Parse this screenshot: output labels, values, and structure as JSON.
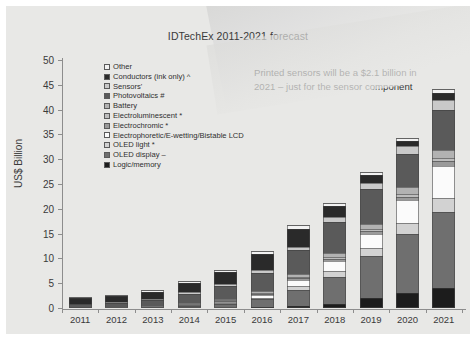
{
  "chart_data": {
    "type": "bar",
    "stacked": true,
    "title": "IDTechEx 2011-2021 forecast",
    "xlabel": "",
    "ylabel": "US$ Billion",
    "ylim": [
      0,
      50
    ],
    "yticks": [
      0,
      5,
      10,
      15,
      20,
      25,
      30,
      35,
      40,
      45,
      50
    ],
    "grid": false,
    "legend_position": "inside-top-left",
    "categories": [
      "2011",
      "2012",
      "2013",
      "2014",
      "2015",
      "2016",
      "2017",
      "2018",
      "2019",
      "2020",
      "2021"
    ],
    "annotation": "Printed sensors will be a $2.1 billion in 2021 – just for the sensor component",
    "series": [
      {
        "name": "Logic/memory",
        "color": "#1c1c1c",
        "values": [
          0.0,
          0.0,
          0.0,
          0.05,
          0.1,
          0.15,
          0.4,
          0.8,
          2.1,
          3.0,
          4.1
        ]
      },
      {
        "name": "OLED display –",
        "color": "#6f6f6f",
        "values": [
          0.0,
          0.0,
          0.1,
          0.3,
          0.8,
          1.6,
          3.3,
          5.5,
          8.4,
          12.0,
          15.3
        ]
      },
      {
        "name": "OLED light *",
        "color": "#d2d2d2",
        "values": [
          0.0,
          0.0,
          0.0,
          0.05,
          0.1,
          0.3,
          0.7,
          1.1,
          1.5,
          2.2,
          2.8
        ]
      },
      {
        "name": "Electrophoretic/E-wetting/Bistable LCD",
        "color": "#fbfbfb",
        "values": [
          0.0,
          0.0,
          0.0,
          0.1,
          0.2,
          0.6,
          1.3,
          2.1,
          3.0,
          4.5,
          6.5
        ]
      },
      {
        "name": "Electrochromic *",
        "color": "#9a9a9a",
        "values": [
          0.0,
          0.0,
          0.05,
          0.1,
          0.15,
          0.2,
          0.3,
          0.4,
          0.5,
          0.7,
          0.9
        ]
      },
      {
        "name": "Electroluminescent *",
        "color": "#bdbdbd",
        "values": [
          0.05,
          0.1,
          0.1,
          0.15,
          0.2,
          0.25,
          0.3,
          0.4,
          0.5,
          0.6,
          0.7
        ]
      },
      {
        "name": "Battery",
        "color": "#b2b2b2",
        "values": [
          0.05,
          0.1,
          0.15,
          0.2,
          0.3,
          0.4,
          0.6,
          0.8,
          1.0,
          1.3,
          1.6
        ]
      },
      {
        "name": "Photovoltaics #",
        "color": "#5a5a5a",
        "values": [
          0.7,
          0.9,
          1.3,
          1.9,
          2.6,
          3.6,
          4.8,
          6.3,
          7.0,
          6.8,
          8.0
        ]
      },
      {
        "name": "Sensors'",
        "color": "#c9c9c9",
        "values": [
          0.1,
          0.15,
          0.2,
          0.3,
          0.4,
          0.5,
          0.7,
          0.9,
          1.2,
          1.6,
          2.1
        ]
      },
      {
        "name": "Conductors (ink only) ^",
        "color": "#2a2a2a",
        "values": [
          1.2,
          1.2,
          1.4,
          1.9,
          2.4,
          3.2,
          3.6,
          2.2,
          1.7,
          1.0,
          1.4
        ]
      },
      {
        "name": "Other",
        "color": "#f2f2f2",
        "values": [
          0.15,
          0.2,
          0.3,
          0.4,
          0.5,
          0.7,
          0.8,
          0.7,
          0.6,
          0.6,
          0.8
        ]
      }
    ],
    "totals": [
      2.25,
      2.65,
      3.6,
      5.45,
      7.75,
      11.5,
      16.8,
      21.2,
      27.5,
      34.3,
      44.2
    ],
    "legend_order_top_to_bottom": [
      "Other",
      "Conductors (ink only) ^",
      "Sensors'",
      "Photovoltaics #",
      "Battery",
      "Electroluminescent *",
      "Electrochromic *",
      "Electrophoretic/E-wetting/Bistable LCD",
      "OLED light *",
      "OLED display –",
      "Logic/memory"
    ]
  }
}
